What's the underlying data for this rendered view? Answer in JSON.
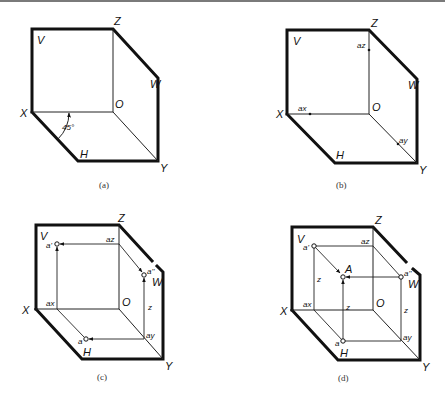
{
  "figures": {
    "a": {
      "caption": "(a)",
      "labels": {
        "V": "V",
        "Z": "Z",
        "W": "W",
        "X": "X",
        "O": "O",
        "H": "H",
        "Y": "Y"
      },
      "angle_label": "45°"
    },
    "b": {
      "caption": "(b)",
      "labels": {
        "V": "V",
        "Z": "Z",
        "W": "W",
        "X": "X",
        "O": "O",
        "H": "H",
        "Y": "Y",
        "ax": "ax",
        "ay": "ay",
        "az": "az"
      }
    },
    "c": {
      "caption": "(c)",
      "labels": {
        "V": "V",
        "Z": "Z",
        "W": "W",
        "X": "X",
        "O": "O",
        "H": "H",
        "Y": "Y",
        "ax": "ax",
        "ay": "ay",
        "az": "az",
        "a": "a",
        "a_prime": "a'",
        "a_double_prime": "a''",
        "z": "z"
      }
    },
    "d": {
      "caption": "(d)",
      "labels": {
        "V": "V",
        "Z": "Z",
        "W": "W",
        "X": "X",
        "O": "O",
        "H": "H",
        "Y": "Y",
        "ax": "ax",
        "ay": "ay",
        "az": "az",
        "a": "a",
        "a_prime": "a'",
        "a_double_prime": "a''",
        "A": "A",
        "z1": "z",
        "z2": "z",
        "z3": "z"
      }
    }
  }
}
